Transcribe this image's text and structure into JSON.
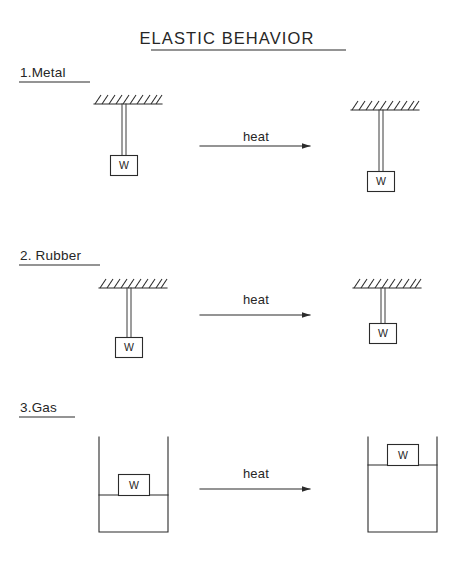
{
  "figure": {
    "title": "ELASTIC  BEHAVIOR",
    "title_underlined": true,
    "background_color": "#ffffff",
    "ink_color": "#2b2b2b",
    "weight_label": "W",
    "process_label": "heat",
    "sections": [
      {
        "id": "metal",
        "label": "1.Metal",
        "label_underlined": true,
        "before": {
          "state": "cold",
          "support": "hatched-ceiling",
          "rod_length_px": 47,
          "weight_label": "W"
        },
        "arrow": {
          "label": "heat",
          "direction": "right"
        },
        "after": {
          "state": "heated",
          "support": "hatched-ceiling",
          "rod_length_px": 62,
          "weight_label": "W",
          "result": "rod expands, weight moves down"
        }
      },
      {
        "id": "rubber",
        "label": "2. Rubber",
        "label_underlined": true,
        "before": {
          "state": "cold",
          "support": "hatched-ceiling",
          "rod_length_px": 50,
          "weight_label": "W"
        },
        "arrow": {
          "label": "heat",
          "direction": "right"
        },
        "after": {
          "state": "heated",
          "support": "hatched-ceiling",
          "rod_length_px": 36,
          "weight_label": "W",
          "result": "rubber contracts, weight moves up"
        }
      },
      {
        "id": "gas",
        "label": "3.Gas",
        "label_underlined": true,
        "before": {
          "state": "cold",
          "container": "open-cylinder",
          "piston_height_px": 37,
          "weight_label": "W"
        },
        "arrow": {
          "label": "heat",
          "direction": "right"
        },
        "after": {
          "state": "heated",
          "container": "open-cylinder",
          "piston_height_px": 67,
          "weight_label": "W",
          "result": "gas expands, piston rises"
        }
      }
    ]
  }
}
